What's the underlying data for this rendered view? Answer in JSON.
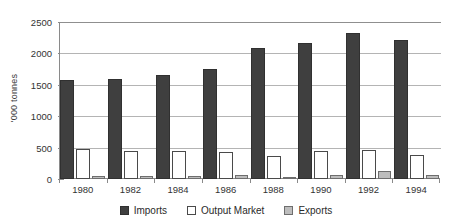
{
  "chart_data": {
    "type": "bar",
    "title": "",
    "subtitle": "",
    "xlabel": "",
    "ylabel": "'000 tonnes",
    "ylim": [
      0,
      2500
    ],
    "yticks": [
      0,
      500,
      1000,
      1500,
      2000,
      2500
    ],
    "ytick_labels": [
      "0",
      "500",
      "1000",
      "1500",
      "2000",
      "2500"
    ],
    "grid": true,
    "legend_position": "bottom",
    "categories": [
      "1980",
      "1982",
      "1984",
      "1986",
      "1988",
      "1990",
      "1992",
      "1994"
    ],
    "series": [
      {
        "name": "Imports",
        "color": "#3f3f3f",
        "values": [
          1570,
          1590,
          1650,
          1750,
          2085,
          2160,
          2320,
          2215
        ]
      },
      {
        "name": "Output Market",
        "color": "#ffffff",
        "values": [
          470,
          440,
          445,
          435,
          370,
          440,
          460,
          390
        ]
      },
      {
        "name": "Exports",
        "color": "#bdbdbd",
        "values": [
          45,
          45,
          50,
          70,
          35,
          60,
          120,
          60
        ]
      }
    ]
  },
  "legend": {
    "items": [
      {
        "label": "Imports",
        "swatch": "imports-swatch"
      },
      {
        "label": "Output Market",
        "swatch": "output-market-swatch"
      },
      {
        "label": "Exports",
        "swatch": "exports-swatch"
      }
    ]
  },
  "colors": {
    "imports": "#3f3f3f",
    "output_market": "#ffffff",
    "exports": "#bdbdbd",
    "axis": "#8a8a8a",
    "gridline": "#b4b4b4",
    "background": "#ffffff"
  }
}
